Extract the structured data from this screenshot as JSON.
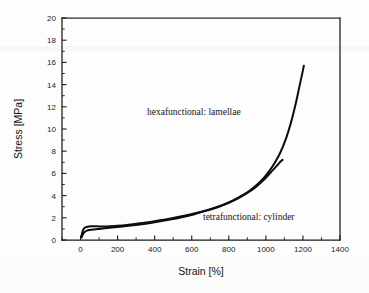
{
  "chart_data": {
    "type": "line",
    "title": "",
    "xlabel": "Strain [%]",
    "ylabel": "Stress [MPa]",
    "xlim": [
      -100,
      1400
    ],
    "ylim": [
      0,
      20
    ],
    "xticks": [
      0,
      200,
      400,
      600,
      800,
      1000,
      1200,
      1400
    ],
    "xticklabels": [
      "0",
      "200",
      "400",
      "600",
      "800",
      "1000",
      "1200",
      "1400"
    ],
    "yticks": [
      0,
      2,
      4,
      6,
      8,
      10,
      12,
      14,
      16,
      18,
      20
    ],
    "yticklabels": [
      "0",
      "2",
      "4",
      "6",
      "8",
      "10",
      "12",
      "14",
      "16",
      "18",
      "20"
    ],
    "grid": false,
    "legend": "none (inline annotations)",
    "line_color": "#0d0d0d",
    "background_color": "#fdfdfd",
    "annotations": [
      {
        "text": "hexafunctional: lamellae",
        "x_data": 520,
        "y_data": 11.1
      },
      {
        "text": "tetrafunctional: cylinder",
        "x_data": 860,
        "y_data": 1.9
      }
    ],
    "series": [
      {
        "name": "hexafunctional: lamellae",
        "end_point": [
          1205,
          15.7
        ],
        "x": [
          5,
          10,
          18,
          28,
          40,
          55,
          70,
          90,
          120,
          160,
          200,
          260,
          320,
          400,
          480,
          560,
          640,
          700,
          760,
          820,
          870,
          910,
          950,
          990,
          1020,
          1050,
          1080,
          1110,
          1135,
          1160,
          1180,
          1195,
          1205
        ],
        "y": [
          0.3,
          0.72,
          1.02,
          1.14,
          1.2,
          1.23,
          1.24,
          1.23,
          1.22,
          1.24,
          1.28,
          1.38,
          1.5,
          1.7,
          1.92,
          2.18,
          2.5,
          2.78,
          3.12,
          3.55,
          4.0,
          4.42,
          4.95,
          5.62,
          6.25,
          7.0,
          7.95,
          9.2,
          10.55,
          12.2,
          13.75,
          14.9,
          15.7
        ]
      },
      {
        "name": "tetrafunctional: cylinder",
        "end_point": [
          1090,
          7.2
        ],
        "x": [
          5,
          12,
          22,
          35,
          50,
          70,
          95,
          130,
          170,
          215,
          270,
          330,
          400,
          470,
          540,
          610,
          680,
          740,
          800,
          850,
          900,
          940,
          975,
          1005,
          1035,
          1060,
          1078,
          1090
        ],
        "y": [
          0.22,
          0.5,
          0.72,
          0.84,
          0.9,
          0.95,
          1.0,
          1.05,
          1.12,
          1.2,
          1.3,
          1.42,
          1.6,
          1.8,
          2.02,
          2.3,
          2.65,
          2.95,
          3.35,
          3.75,
          4.25,
          4.7,
          5.2,
          5.7,
          6.25,
          6.7,
          7.05,
          7.22
        ]
      }
    ]
  },
  "figure": {
    "xlabel": "Strain [%]",
    "ylabel": "Stress [MPa]",
    "annotation_hexafunctional": "hexafunctional: lamellae",
    "annotation_tetrafunctional": "tetrafunctional: cylinder"
  }
}
